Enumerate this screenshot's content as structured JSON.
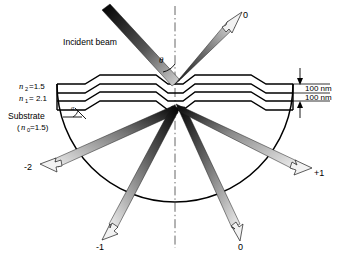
{
  "figure": {
    "background_color": "#ffffff",
    "line_color": "#000000",
    "width": 350,
    "height": 254
  },
  "labels": {
    "incident_beam": "Incident beam",
    "theta_symbol": "θ",
    "alpha_symbol": "α",
    "n2_label": "n",
    "n2_sub": "2",
    "n2_value": "=1.5",
    "n1_label": "n",
    "n1_sub": "1",
    "n1_value": "= 2.1",
    "substrate_label": "Substrate",
    "substrate_paren_open": "(",
    "substrate_n0": "n",
    "substrate_n0_sub": "0",
    "substrate_n0_value": "=1.5)",
    "thickness_top": "100 nm",
    "thickness_bottom": "100 nm"
  },
  "orders": {
    "reflected_zero": "0",
    "transmitted_minus_two": "-2",
    "transmitted_minus_one": "-1",
    "transmitted_zero": "0",
    "transmitted_plus_one": "+1"
  },
  "beams": [
    {
      "name": "incident-beam",
      "order": "incident",
      "direction": "down-right",
      "label": ""
    },
    {
      "name": "reflected-beam-0",
      "order": "0",
      "direction": "up-right",
      "label": "0"
    },
    {
      "name": "transmitted-beam-minus2",
      "order": "-2",
      "direction": "down-left",
      "label": "-2"
    },
    {
      "name": "transmitted-beam-minus1",
      "order": "-1",
      "direction": "down-left",
      "label": "-1"
    },
    {
      "name": "transmitted-beam-0",
      "order": "0",
      "direction": "down-right",
      "label": "0"
    },
    {
      "name": "transmitted-beam-plus1",
      "order": "+1",
      "direction": "down-right",
      "label": "+1"
    }
  ]
}
